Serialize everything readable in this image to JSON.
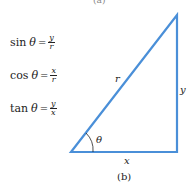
{
  "top_fragment": "(a)",
  "formulas": [
    {
      "fn": "sin",
      "angle": "θ",
      "eq": "=",
      "num": "y",
      "den": "r"
    },
    {
      "fn": "cos",
      "angle": "θ",
      "eq": "=",
      "num": "x",
      "den": "r"
    },
    {
      "fn": "tan",
      "angle": "θ",
      "eq": "=",
      "num": "y",
      "den": "x"
    }
  ],
  "triangle": {
    "stroke_color": "#4a8fd8",
    "labels": {
      "hypotenuse": "r",
      "opposite": "y",
      "adjacent": "x",
      "angle": "θ"
    }
  },
  "caption": "(b)"
}
